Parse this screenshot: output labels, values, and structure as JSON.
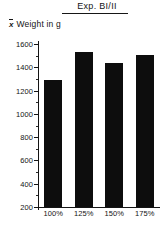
{
  "chart_data": {
    "type": "bar",
    "title": "Exp. BI/II",
    "xlabel": "",
    "ylabel": "x̄ Weight in g",
    "ylabel_symbol": "x",
    "ylabel_text": "Weight in g",
    "categories": [
      "100%",
      "125%",
      "150%",
      "175%"
    ],
    "values": [
      1290,
      1530,
      1440,
      1505
    ],
    "ylim": [
      200,
      1600
    ],
    "ytick_labels": [
      "200",
      "400",
      "600",
      "800",
      "1000",
      "1200",
      "1400",
      "1600"
    ],
    "ytick_values": [
      200,
      400,
      600,
      800,
      1000,
      1200,
      1400,
      1600
    ],
    "yminor_step": 100,
    "grid": false,
    "legend": false,
    "bar_color": "#0d0d0d",
    "axis_color": "#141414"
  }
}
